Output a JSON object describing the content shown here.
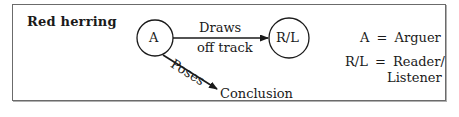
{
  "title": "Red herring",
  "nodes": {
    "arguer": {
      "label": "A"
    },
    "reader_listener": {
      "label": "R/L"
    },
    "conclusion": {
      "label": "Conclusion"
    }
  },
  "edges": {
    "draws": {
      "label_line1": "Draws",
      "label_line2": "off track",
      "from": "A",
      "to": "R/L"
    },
    "poses": {
      "label": "Poses",
      "from": "A",
      "to": "Conclusion"
    }
  },
  "legend": {
    "row1": {
      "key": "A",
      "eq": "=",
      "value": "Arguer"
    },
    "row2": {
      "key": "R/L",
      "eq": "=",
      "value_line1": "Reader/",
      "value_line2": "Listener"
    }
  },
  "colors": {
    "ink": "#1a1a1a",
    "border": "#6b6b6b"
  }
}
